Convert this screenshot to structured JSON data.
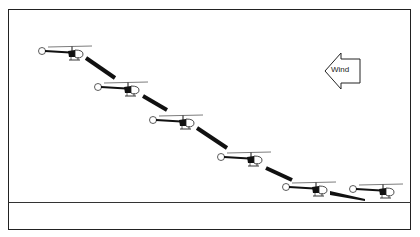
{
  "diagram": {
    "title": "",
    "wind": {
      "label": "Wind",
      "direction": "left"
    },
    "helicopter_count": 6,
    "flight_path": "descending approach from upper-left to lower-right ending on the ground, into the wind",
    "colors": {
      "line": "#111111",
      "background": "#ffffff"
    }
  }
}
